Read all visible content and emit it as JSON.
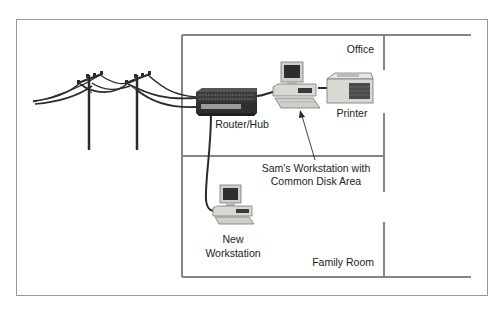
{
  "diagram": {
    "title": "",
    "colors": {
      "frame": "#9a9a9a",
      "wall": "#858585",
      "cable": "#2b2b2b",
      "device_dark": "#3a3a3a",
      "device_light": "#d9d9d4",
      "text": "#222222"
    },
    "rooms": [
      {
        "id": "office",
        "label": "Office"
      },
      {
        "id": "family_room",
        "label": "Family Room"
      }
    ],
    "nodes": [
      {
        "id": "utility_poles",
        "label": "",
        "icon": "utility-pole-icon"
      },
      {
        "id": "router",
        "label": "Router/Hub",
        "icon": "router-hub-icon"
      },
      {
        "id": "sams_workstation",
        "label_lines": [
          "Sam's Workstation with",
          "Common Disk Area"
        ],
        "icon": "desktop-computer-icon"
      },
      {
        "id": "printer",
        "label": "Printer",
        "icon": "printer-icon"
      },
      {
        "id": "new_workstation",
        "label_lines": [
          "New",
          "Workstation"
        ],
        "icon": "desktop-computer-icon"
      }
    ],
    "edges": [
      {
        "from": "utility_poles",
        "to": "router",
        "type": "cable"
      },
      {
        "from": "router",
        "to": "sams_workstation",
        "type": "cable"
      },
      {
        "from": "sams_workstation",
        "to": "printer",
        "type": "cable"
      },
      {
        "from": "router",
        "to": "new_workstation",
        "type": "cable"
      },
      {
        "from": "sams_workstation_caption",
        "to": "sams_workstation",
        "type": "arrow"
      }
    ]
  }
}
